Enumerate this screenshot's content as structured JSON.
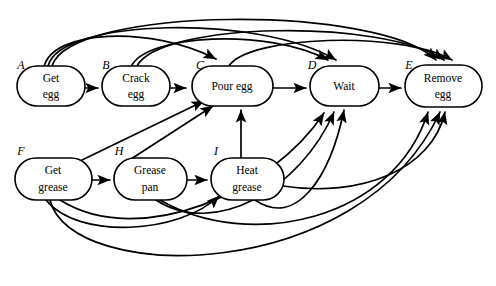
{
  "diagram": {
    "kind": "precedence-graph",
    "background_color": "#ffffff",
    "line_color": "#000000",
    "nodes": [
      {
        "id": "A",
        "tag": "A",
        "lines": [
          "Get",
          "egg"
        ],
        "cx": 51,
        "cy": 86,
        "rx": 34,
        "ry": 20,
        "tag_x": 21,
        "tag_y": 66
      },
      {
        "id": "B",
        "tag": "B",
        "lines": [
          "Crack",
          "egg"
        ],
        "cx": 136,
        "cy": 86,
        "rx": 34,
        "ry": 20,
        "tag_x": 106,
        "tag_y": 66
      },
      {
        "id": "C",
        "tag": "C",
        "lines": [
          "Pour egg"
        ],
        "cx": 232,
        "cy": 86,
        "rx": 40,
        "ry": 20,
        "tag_x": 200,
        "tag_y": 66
      },
      {
        "id": "D",
        "tag": "D",
        "lines": [
          "Wait"
        ],
        "cx": 344,
        "cy": 86,
        "rx": 34,
        "ry": 20,
        "tag_x": 308,
        "tag_y": 66
      },
      {
        "id": "E",
        "tag": "E",
        "lines": [
          "Remove",
          "egg"
        ],
        "cx": 443,
        "cy": 86,
        "rx": 38,
        "ry": 21,
        "tag_x": 407,
        "tag_y": 66
      },
      {
        "id": "F",
        "tag": "F",
        "lines": [
          "Get",
          "grease"
        ],
        "cx": 53,
        "cy": 178,
        "rx": 38,
        "ry": 21,
        "tag_x": 21,
        "tag_y": 152
      },
      {
        "id": "H",
        "tag": "H",
        "lines": [
          "Grease",
          "pan"
        ],
        "cx": 150,
        "cy": 178,
        "rx": 36,
        "ry": 21,
        "tag_x": 117,
        "tag_y": 152
      },
      {
        "id": "I",
        "tag": "I",
        "lines": [
          "Heat",
          "grease"
        ],
        "cx": 247,
        "cy": 178,
        "rx": 36,
        "ry": 21,
        "tag_x": 214,
        "tag_y": 152
      }
    ],
    "edge_count": 22,
    "sequential_edges": [
      {
        "from": "A",
        "to": "B"
      },
      {
        "from": "B",
        "to": "C"
      },
      {
        "from": "C",
        "to": "D"
      },
      {
        "from": "D",
        "to": "E"
      },
      {
        "from": "F",
        "to": "H"
      },
      {
        "from": "H",
        "to": "I"
      }
    ],
    "backward_arc_edges": [
      {
        "from": "A",
        "to": "C"
      },
      {
        "from": "A",
        "to": "D"
      },
      {
        "from": "A",
        "to": "E"
      },
      {
        "from": "B",
        "to": "D"
      },
      {
        "from": "B",
        "to": "E"
      },
      {
        "from": "C",
        "to": "E"
      }
    ],
    "cross_edges": [
      {
        "from": "F",
        "to": "C"
      },
      {
        "from": "F",
        "to": "D"
      },
      {
        "from": "F",
        "to": "E"
      },
      {
        "from": "H",
        "to": "C"
      },
      {
        "from": "H",
        "to": "D"
      },
      {
        "from": "H",
        "to": "E"
      },
      {
        "from": "I",
        "to": "C"
      },
      {
        "from": "I",
        "to": "D"
      },
      {
        "from": "I",
        "to": "E"
      },
      {
        "from": "F",
        "to": "I"
      }
    ]
  }
}
